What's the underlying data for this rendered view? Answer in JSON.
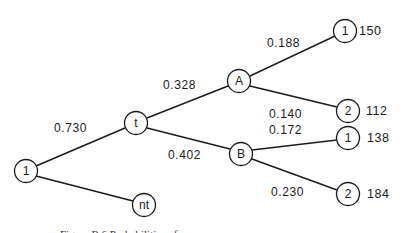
{
  "diagram": {
    "type": "probability-tree",
    "nodes": {
      "root": {
        "label": "1",
        "cx": 26,
        "cy": 171
      },
      "t": {
        "label": "t",
        "cx": 136,
        "cy": 123
      },
      "nt": {
        "label": "nt",
        "cx": 144,
        "cy": 205
      },
      "A": {
        "label": "A",
        "cx": 239,
        "cy": 81
      },
      "B": {
        "label": "B",
        "cx": 241,
        "cy": 154
      },
      "A1": {
        "label": "1",
        "cx": 345,
        "cy": 31,
        "value": "150"
      },
      "A2": {
        "label": "2",
        "cx": 348,
        "cy": 111,
        "value": "112"
      },
      "B1": {
        "label": "1",
        "cx": 348,
        "cy": 138,
        "value": "138"
      },
      "B2": {
        "label": "2",
        "cx": 348,
        "cy": 194,
        "value": "184"
      }
    },
    "edges": [
      {
        "from": "root",
        "to": "t",
        "probability": "0.730"
      },
      {
        "from": "root",
        "to": "nt",
        "probability": ""
      },
      {
        "from": "t",
        "to": "A",
        "probability": "0.328"
      },
      {
        "from": "t",
        "to": "B",
        "probability": "0.402"
      },
      {
        "from": "A",
        "to": "A1",
        "probability": "0.188"
      },
      {
        "from": "A",
        "to": "A2",
        "probability": "0.140"
      },
      {
        "from": "B",
        "to": "B1",
        "probability": "0.172"
      },
      {
        "from": "B",
        "to": "B2",
        "probability": "0.230"
      }
    ],
    "caption": "Figure B.6  Probabilities of ..."
  }
}
